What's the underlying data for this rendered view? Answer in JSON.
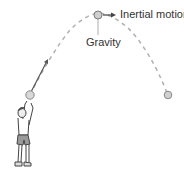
{
  "diagram": {
    "labels": {
      "inertial_motion": "Inertial motion",
      "gravity": "Gravity"
    },
    "colors": {
      "trajectory": "#b0b0b0",
      "ball_fill": "#cfcfcf",
      "ball_stroke": "#7a7a7a",
      "arrow": "#444444",
      "text": "#333333"
    },
    "elements": [
      {
        "name": "thrower-figure",
        "description": "person throwing ball upward"
      },
      {
        "name": "launch-ball",
        "description": "ball at release point"
      },
      {
        "name": "apex-ball",
        "description": "ball at top of trajectory"
      },
      {
        "name": "landing-ball",
        "description": "ball descending on right"
      },
      {
        "name": "trajectory-path",
        "description": "dashed parabolic arc"
      },
      {
        "name": "inertial-motion-arrow",
        "description": "horizontal arrow from apex ball"
      },
      {
        "name": "gravity-arrow",
        "description": "vertical line down from apex ball"
      },
      {
        "name": "launch-velocity-arrow",
        "description": "arrow from launch ball up-right"
      }
    ]
  }
}
